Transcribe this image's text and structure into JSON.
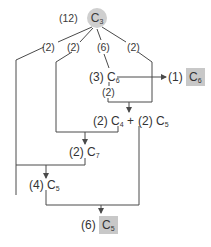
{
  "diagram": {
    "root": {
      "count": "(12)",
      "molecule": "C",
      "subscript": "3"
    },
    "branches": [
      "(2)",
      "(2)",
      "(6)",
      "(2)"
    ],
    "nodes": {
      "c6_mid": {
        "count": "(3)",
        "molecule": "C",
        "subscript": "6"
      },
      "c6_mid_branch": "(2)",
      "c6_out": {
        "count": "(1)",
        "molecule": "C",
        "subscript": "6"
      },
      "c4": {
        "count": "(2)",
        "molecule": "C",
        "subscript": "4"
      },
      "plus": "+",
      "c5_mid": {
        "count": "(2)",
        "molecule": "C",
        "subscript": "5"
      },
      "c7": {
        "count": "(2)",
        "molecule": "C",
        "subscript": "7"
      },
      "c5_low": {
        "count": "(4)",
        "molecule": "C",
        "subscript": "5"
      },
      "c5_out": {
        "count": "(6)",
        "molecule": "C",
        "subscript": "5"
      }
    },
    "colors": {
      "line": "#4a4a4a",
      "highlight": "#c8c8c8",
      "root_fill": "#cfcfcf"
    }
  }
}
